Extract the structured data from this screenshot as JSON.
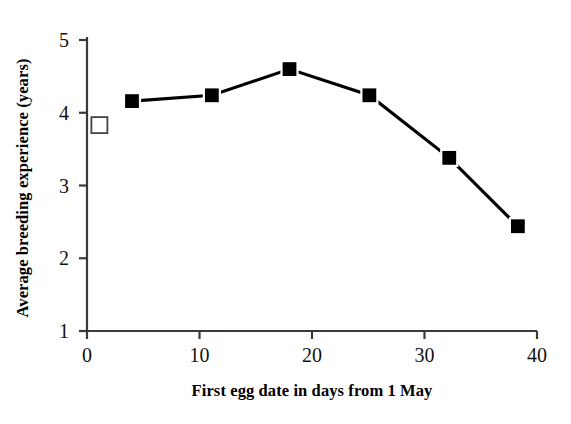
{
  "chart_data": {
    "type": "line",
    "title": "",
    "xlabel": "First egg date in days from 1 May",
    "ylabel": "Average breeding experience (years)",
    "xlim": [
      0,
      40
    ],
    "ylim": [
      1,
      5
    ],
    "xticks": [
      0,
      10,
      20,
      30,
      40
    ],
    "yticks": [
      1,
      2,
      3,
      4,
      5
    ],
    "xtick_labels": [
      "0",
      "10",
      "20",
      "30",
      "40"
    ],
    "ytick_labels": [
      "1",
      "2",
      "3",
      "4",
      "5"
    ],
    "grid": false,
    "legend": null,
    "series": [
      {
        "name": "open-square-point",
        "marker": "open-square",
        "connected": false,
        "color": "#000000",
        "points": [
          {
            "x": 1.1,
            "y": 3.83
          }
        ]
      },
      {
        "name": "breeding-experience-line",
        "marker": "filled-square",
        "connected": true,
        "color": "#000000",
        "points": [
          {
            "x": 4.0,
            "y": 4.16
          },
          {
            "x": 11.1,
            "y": 4.24
          },
          {
            "x": 18.0,
            "y": 4.6
          },
          {
            "x": 25.1,
            "y": 4.24
          },
          {
            "x": 32.2,
            "y": 3.38
          },
          {
            "x": 38.3,
            "y": 2.44
          }
        ]
      }
    ]
  },
  "style": {
    "axis_color": "#3a3a3a",
    "line_color": "#000000",
    "marker_fill": "#000000",
    "marker_edge": "#ffffff",
    "open_marker_fill": "#ffffff",
    "open_marker_edge": "#444444",
    "background": "#ffffff"
  }
}
